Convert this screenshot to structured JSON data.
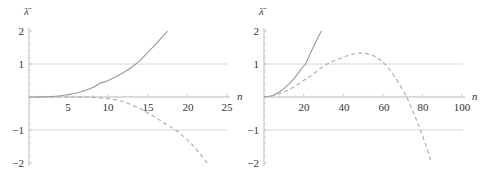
{
  "chart_data": [
    {
      "type": "line",
      "title": "",
      "xlabel": "n",
      "ylabel": "λ̄",
      "xlim": [
        0,
        25
      ],
      "ylim": [
        -2,
        2
      ],
      "xticks": [
        5,
        10,
        15,
        20,
        25
      ],
      "yticks": [
        -2,
        -1,
        1,
        2
      ],
      "xtick_labels": [
        "5",
        "10",
        "15",
        "20",
        "25"
      ],
      "ytick_labels": [
        "−2",
        "−1",
        "1",
        "2"
      ],
      "reference_lines": [
        1,
        -1
      ],
      "grid": false,
      "legend": null,
      "series": [
        {
          "name": "solid",
          "style": "solid",
          "x": [
            0,
            2,
            4,
            6,
            8,
            9,
            10,
            12,
            13.5,
            15,
            16,
            17.5
          ],
          "y": [
            0,
            0.005,
            0.04,
            0.12,
            0.28,
            0.42,
            0.5,
            0.75,
            1.0,
            1.35,
            1.6,
            2.0
          ]
        },
        {
          "name": "dashed",
          "style": "dashed",
          "x": [
            0,
            4,
            8,
            10,
            12,
            14,
            15,
            16,
            17,
            18.5,
            20,
            21,
            22.5
          ],
          "y": [
            0,
            0,
            -0.01,
            -0.05,
            -0.15,
            -0.35,
            -0.48,
            -0.62,
            -0.78,
            -1.0,
            -1.3,
            -1.55,
            -2.0
          ]
        }
      ]
    },
    {
      "type": "line",
      "title": "",
      "xlabel": "n",
      "ylabel": "λ̄",
      "xlim": [
        0,
        100
      ],
      "ylim": [
        -2,
        2
      ],
      "xticks": [
        20,
        40,
        60,
        80,
        100
      ],
      "yticks": [
        -2,
        -1,
        1,
        2
      ],
      "xtick_labels": [
        "20",
        "40",
        "60",
        "80",
        "100"
      ],
      "ytick_labels": [
        "−2",
        "−1",
        "1",
        "2"
      ],
      "reference_lines": [
        1,
        -1
      ],
      "grid": false,
      "legend": null,
      "series": [
        {
          "name": "solid",
          "style": "solid",
          "x": [
            0,
            4,
            8,
            12,
            16,
            20,
            21,
            24,
            26,
            29
          ],
          "y": [
            0,
            0.04,
            0.16,
            0.36,
            0.62,
            0.94,
            1.0,
            1.4,
            1.65,
            2.0
          ]
        },
        {
          "name": "dashed",
          "style": "dashed",
          "x": [
            0,
            5,
            10,
            15,
            20,
            25,
            32,
            39,
            44,
            49,
            54,
            58,
            61,
            66,
            72,
            76,
            79,
            82,
            84.5
          ],
          "y": [
            0,
            0.05,
            0.15,
            0.3,
            0.5,
            0.7,
            1.0,
            1.18,
            1.28,
            1.33,
            1.28,
            1.15,
            1.0,
            0.62,
            0.0,
            -0.55,
            -1.0,
            -1.5,
            -2.0
          ]
        }
      ]
    }
  ],
  "charts": {
    "left": {
      "ylabel": "λ̄",
      "xlabel": "n",
      "xtick_labels": [
        "5",
        "10",
        "15",
        "20",
        "25"
      ],
      "ytick_labels": [
        "2",
        "1",
        "−1",
        "−2"
      ]
    },
    "right": {
      "ylabel": "λ̄",
      "xlabel": "n",
      "xtick_labels": [
        "20",
        "40",
        "60",
        "80",
        "100"
      ],
      "ytick_labels": [
        "2",
        "1",
        "−1",
        "−2"
      ]
    }
  },
  "colors": {
    "curve": "#9a9a9a",
    "reference_line": "#d8d8d8",
    "axis": "#bbbbbb",
    "text": "#333333"
  }
}
